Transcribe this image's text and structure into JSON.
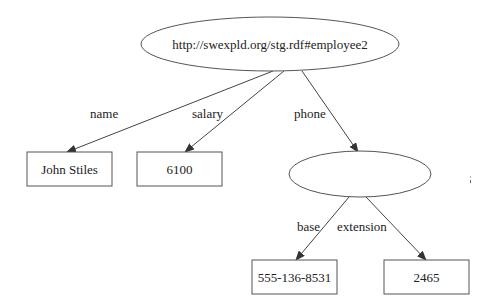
{
  "diagram": {
    "type": "rdf-graph",
    "nodes": [
      {
        "id": "employee",
        "shape": "ellipse",
        "label": "http://swexpld.org/stg.rdf#employee2"
      },
      {
        "id": "name_val",
        "shape": "box",
        "label": "John Stiles"
      },
      {
        "id": "salary_val",
        "shape": "box",
        "label": "6100"
      },
      {
        "id": "phone_node",
        "shape": "ellipse",
        "label": ""
      },
      {
        "id": "base_val",
        "shape": "box",
        "label": "555-136-8531"
      },
      {
        "id": "ext_val",
        "shape": "box",
        "label": "2465"
      }
    ],
    "edges": [
      {
        "from": "employee",
        "to": "name_val",
        "label": "name"
      },
      {
        "from": "employee",
        "to": "salary_val",
        "label": "salary"
      },
      {
        "from": "employee",
        "to": "phone_node",
        "label": "phone"
      },
      {
        "from": "phone_node",
        "to": "base_val",
        "label": "base"
      },
      {
        "from": "phone_node",
        "to": "ext_val",
        "label": "extension"
      }
    ]
  }
}
